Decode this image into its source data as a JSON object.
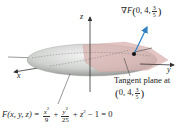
{
  "figure": {
    "type": "ellipsoid with tangent plane and gradient vector",
    "axes": {
      "x_label": "x",
      "y_label": "y",
      "z_label": "z"
    },
    "gradient_label": {
      "prefix": "∇F",
      "args": "0, 4,",
      "frac_num": "3",
      "frac_den": "5"
    },
    "tangent_plane_label": {
      "line1": "Tangent plane at",
      "args": "0, 4,",
      "frac_num": "3",
      "frac_den": "5"
    },
    "equation": {
      "lhs": "F(x, y, z) =",
      "term1_num": "x",
      "term1_num_exp": "2",
      "term1_den": "9",
      "plus1": "+",
      "term2_num": "y",
      "term2_num_exp": "2",
      "term2_den": "25",
      "rest": "+ z",
      "rest_exp": "2",
      "tail": "− 1 = 0"
    },
    "colors": {
      "ellipsoid": "#c9cbc9",
      "plane": "#d9b3b0",
      "gradient_arrow": "#2f7fc1",
      "axes": "#333333"
    }
  }
}
